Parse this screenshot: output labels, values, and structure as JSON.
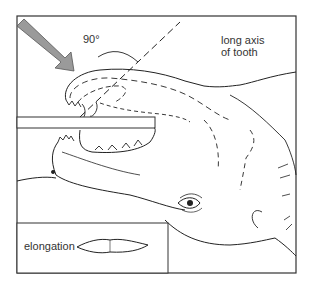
{
  "figure": {
    "angle_label": "90°",
    "axis_label_line1": "long axis",
    "axis_label_line2": "of tooth",
    "inset_label": "elongation"
  },
  "colors": {
    "line": "#222222",
    "arrow_fill": "#9a9a9a",
    "arrow_stroke": "#555555",
    "frame": "#333333",
    "background": "#ffffff"
  }
}
